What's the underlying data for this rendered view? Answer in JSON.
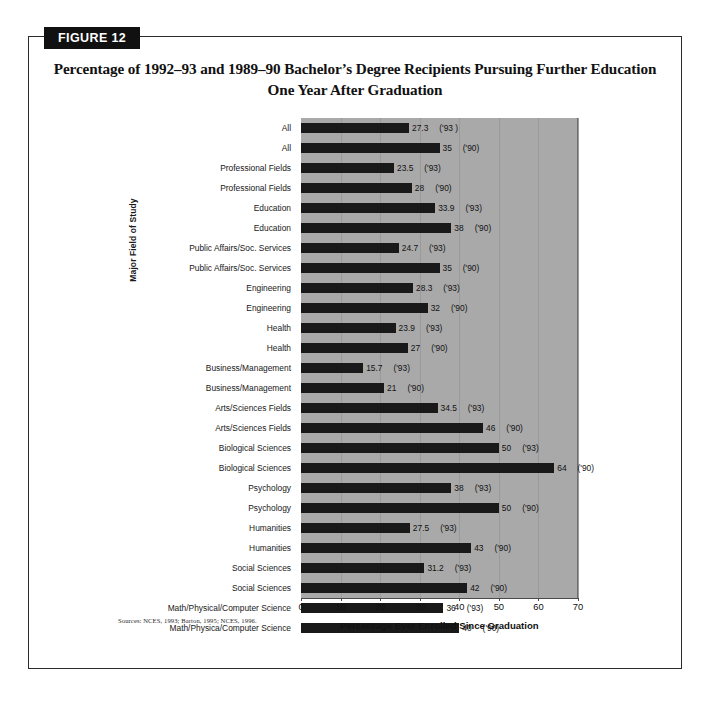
{
  "figure": {
    "badge_label": "FIGURE 12",
    "title": "Percentage of 1992–93 and 1989–90 Bachelor’s Degree Recipients Pursuing Further Education One Year After Graduation",
    "sources": "Sources:  NCES, 1993; Barton, 1995; NCES, 1996."
  },
  "colors": {
    "bar": "#191919",
    "plot_background": "#a9a9a9",
    "gridline": "#9a9a9a",
    "badge_background": "#111111",
    "badge_text": "#ffffff",
    "frame_border": "#2b2b2b"
  },
  "chart_data": {
    "type": "bar",
    "orientation": "horizontal",
    "title": "Percentage of 1992–93 and 1989–90 Bachelor’s Degree Recipients Pursuing Further Education One Year After Graduation",
    "xlabel": "Percentage Ever Enrolled Since Graduation",
    "ylabel": "Major Field of Study",
    "xlim": [
      0,
      70
    ],
    "xticks": [
      0,
      10,
      20,
      30,
      40,
      50,
      60,
      70
    ],
    "grid": "vertical",
    "legend": "none",
    "categories": [
      "All",
      "All",
      "Professional Fields",
      "Professional Fields",
      "Education",
      "Education",
      "Public Affairs/Soc. Services",
      "Public Affairs/Soc. Services",
      "Engineering",
      "Engineering",
      "Health",
      "Health",
      "Business/Management",
      "Business/Management",
      "Arts/Sciences Fields",
      "Arts/Sciences Fields",
      "Biological Sciences",
      "Biological Sciences",
      "Psychology",
      "Psychology",
      "Humanities",
      "Humanities",
      "Social Sciences",
      "Social Sciences",
      "Math/Physical/Computer Science",
      "Math/Physica/Computer Science"
    ],
    "values": [
      27.3,
      35,
      23.5,
      28,
      33.9,
      38,
      24.7,
      35,
      28.3,
      32,
      23.9,
      27,
      15.7,
      21,
      34.5,
      46,
      50,
      64,
      38,
      50,
      27.5,
      43,
      31.2,
      42,
      36,
      40
    ],
    "value_labels": [
      "27.3",
      "35",
      "23.5",
      "28",
      "33.9",
      "38",
      "24.7",
      "35",
      "28.3",
      "32",
      "23.9",
      "27",
      "15.7",
      "21",
      "34.5",
      "46",
      "50",
      "64",
      "38",
      "50",
      "27.5",
      "43",
      "31.2",
      "42",
      "36",
      "40"
    ],
    "year_labels": [
      "('93 )",
      "('90)",
      "('93)",
      "('90)",
      "('93)",
      "('90)",
      "('93)",
      "('90)",
      "('93)",
      "('90)",
      "('93)",
      "('90)",
      "('93)",
      "('90)",
      "('93)",
      "('90)",
      "('93)",
      "('90)",
      "('93)",
      "('90)",
      "('93)",
      "('90)",
      "('93)",
      "('90)",
      "('93)",
      "('90)"
    ]
  }
}
